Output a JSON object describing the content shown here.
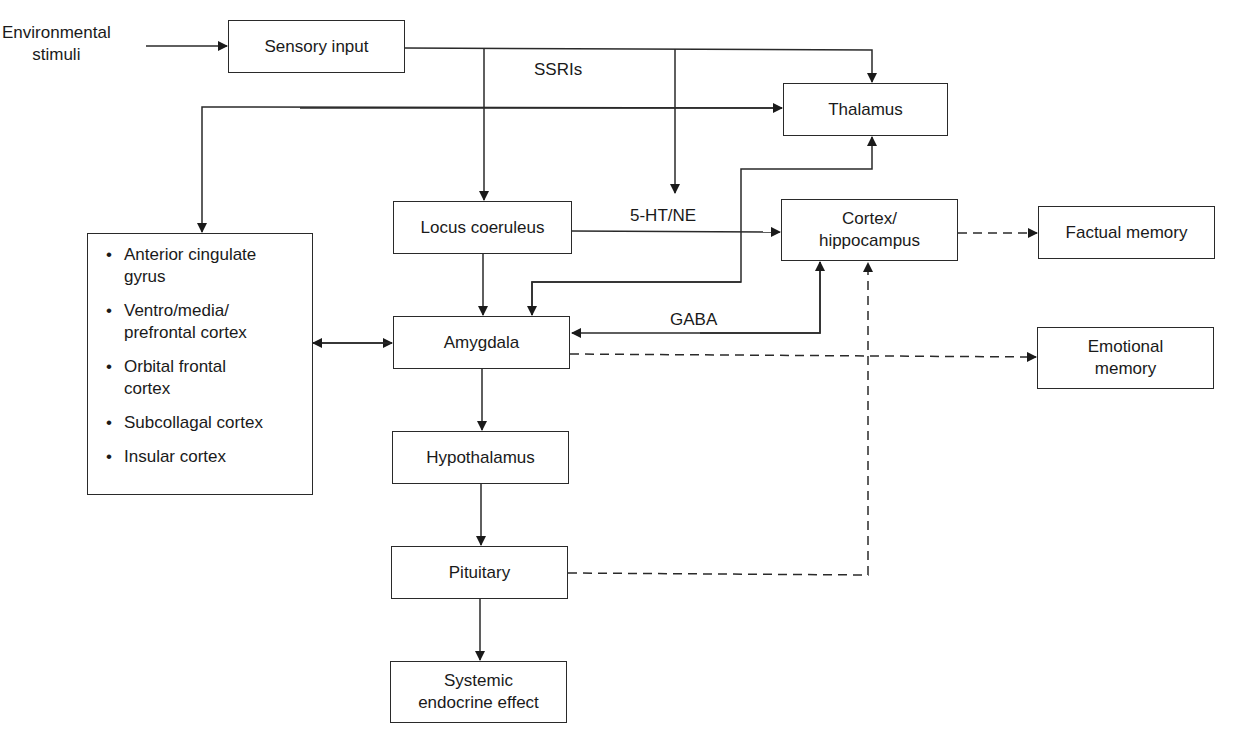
{
  "input_label": "Environmental\nstimuli",
  "nodes": {
    "sensory_input": "Sensory input",
    "thalamus": "Thalamus",
    "locus_coeruleus": "Locus coeruleus",
    "cortex_hippocampus": "Cortex/\nhippocampus",
    "factual_memory": "Factual memory",
    "amygdala": "Amygdala",
    "emotional_memory": "Emotional\nmemory",
    "hypothalamus": "Hypothalamus",
    "pituitary": "Pituitary",
    "systemic_endocrine": "Systemic\nendocrine effect"
  },
  "cortical_regions": [
    "Anterior cingulate\ngyrus",
    "Ventro/media/\nprefrontal cortex",
    "Orbital frontal\ncortex",
    "Subcollagal cortex",
    "Insular cortex"
  ],
  "edge_labels": {
    "ssris": "SSRIs",
    "ht_ne": "5-HT/NE",
    "gaba": "GABA"
  },
  "edges": [
    {
      "from": "Environmental stimuli",
      "to": "Sensory input",
      "style": "solid"
    },
    {
      "from": "Sensory input",
      "to": "Thalamus",
      "style": "solid"
    },
    {
      "from": "Sensory input",
      "to": "Locus coeruleus",
      "style": "solid"
    },
    {
      "from": "Sensory input (SSRIs)",
      "to": "Cortex/hippocampus path",
      "style": "solid"
    },
    {
      "from": "Thalamus",
      "to": "Cortical regions",
      "style": "solid",
      "bidirectional": true
    },
    {
      "from": "Locus coeruleus",
      "to": "Cortex/hippocampus",
      "label": "5-HT/NE",
      "style": "solid"
    },
    {
      "from": "Locus coeruleus",
      "to": "Amygdala",
      "style": "solid"
    },
    {
      "from": "Amygdala",
      "to": "Thalamus",
      "style": "solid",
      "bidirectional": true
    },
    {
      "from": "Amygdala",
      "to": "Cortex/hippocampus",
      "label": "GABA",
      "style": "solid",
      "bidirectional": true
    },
    {
      "from": "Cortical regions",
      "to": "Amygdala",
      "style": "solid",
      "bidirectional": true
    },
    {
      "from": "Cortex/hippocampus",
      "to": "Factual memory",
      "style": "dashed"
    },
    {
      "from": "Amygdala",
      "to": "Emotional memory",
      "style": "dashed"
    },
    {
      "from": "Amygdala",
      "to": "Hypothalamus",
      "style": "solid"
    },
    {
      "from": "Hypothalamus",
      "to": "Pituitary",
      "style": "solid"
    },
    {
      "from": "Pituitary",
      "to": "Systemic endocrine effect",
      "style": "solid"
    },
    {
      "from": "Pituitary",
      "to": "Cortex/hippocampus",
      "style": "dashed"
    }
  ]
}
